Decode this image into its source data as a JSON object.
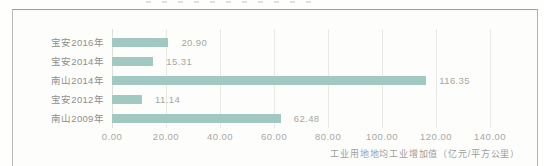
{
  "chart_data": {
    "type": "bar",
    "orientation": "horizontal",
    "title": "",
    "categories": [
      "宝安2016年",
      "宝安2014年",
      "南山2014年",
      "宝安2012年",
      "南山2009年"
    ],
    "values": [
      20.9,
      15.31,
      116.35,
      11.14,
      62.48
    ],
    "value_labels": [
      "20.90",
      "15.31",
      "116.35",
      "11.14",
      "62.48"
    ],
    "xlabel": "工业用地地均工业增加值（亿元/平方公里）",
    "ylabel": "",
    "x_ticks": [
      0,
      20,
      40,
      60,
      80,
      100,
      120,
      140
    ],
    "x_tick_labels": [
      "0.00",
      "20.00",
      "40.00",
      "60.00",
      "80.00",
      "100.00",
      "120.00",
      "140.00"
    ],
    "xlim": [
      0,
      157
    ],
    "grid": true,
    "legend": "none",
    "bar_color": "#a1c9c1",
    "gridline_color": "#e8e8e5"
  }
}
